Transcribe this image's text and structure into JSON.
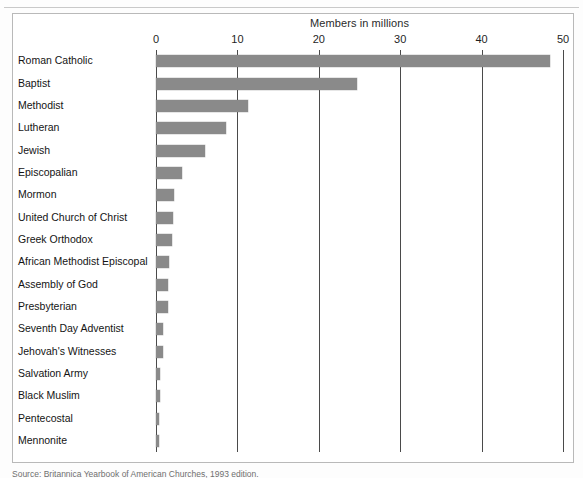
{
  "chart_data": {
    "type": "bar",
    "orientation": "horizontal",
    "title": "Members in millions",
    "xlabel": "",
    "ylabel": "",
    "xlim": [
      0,
      50
    ],
    "xticks": [
      0,
      10,
      20,
      30,
      40,
      50
    ],
    "xtick_labels": [
      "0",
      "10",
      "20",
      "30",
      "40",
      "50"
    ],
    "grid": "vertical",
    "legend": "none",
    "bar_color": "#8a8a8a",
    "categories": [
      "Roman Catholic",
      "Baptist",
      "Methodist",
      "Lutheran",
      "Jewish",
      "Episcopalian",
      "Mormon",
      "United Church of Christ",
      "Greek Orthodox",
      "African Methodist Episcopal",
      "Assembly of God",
      "Presbyterian",
      "Seventh Day Adventist",
      "Jehovah's Witnesses",
      "Salvation Army",
      "Black Muslim",
      "Pentecostal",
      "Mennonite"
    ],
    "values": [
      48.4,
      24.7,
      11.3,
      8.6,
      6.0,
      3.2,
      2.2,
      2.1,
      2.0,
      1.6,
      1.5,
      1.5,
      0.9,
      0.8,
      0.5,
      0.5,
      0.4,
      0.4
    ]
  },
  "footer": {
    "source": "Source: Britannica Yearbook of American Churches, 1993 edition."
  }
}
